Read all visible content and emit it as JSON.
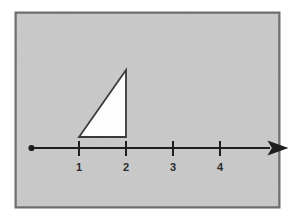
{
  "figure": {
    "panel": {
      "name": "figure-panel",
      "background_color": "#c9c9c9",
      "border_color": "#6e6e6e",
      "x": 15,
      "y": 12,
      "width": 265,
      "height": 196
    }
  },
  "chart_data": {
    "type": "line",
    "xlabel": "",
    "ylabel": "",
    "grid": false,
    "legend": null,
    "axis": {
      "name": "number-line",
      "orientation": "horizontal",
      "color": "#1e1e1e",
      "y_pixel": 148,
      "start_pixel": 31,
      "end_pixel": 275,
      "start_cap": "dot",
      "end_cap": "arrow",
      "xlim": [
        0,
        5.2
      ],
      "tick_spacing_pixels": 47
    },
    "ticks": [
      {
        "label": "1",
        "value": 1,
        "x_pixel": 79
      },
      {
        "label": "2",
        "value": 2,
        "x_pixel": 126
      },
      {
        "label": "3",
        "value": 3,
        "x_pixel": 173
      },
      {
        "label": "4",
        "value": 4,
        "x_pixel": 220
      }
    ],
    "tick_labels": [
      "1",
      "2",
      "3",
      "4"
    ],
    "shapes": [
      {
        "name": "right-triangle",
        "type": "triangle",
        "fill": "#fdfdfd",
        "stroke": "#3a3a3a",
        "right_angle_at": "bottom-right",
        "base_from_value": 1,
        "base_to_value": 2,
        "base_width_units": 1,
        "height_units": 1.43,
        "vertices_pixels": [
          {
            "x": 79,
            "y": 137
          },
          {
            "x": 126,
            "y": 137
          },
          {
            "x": 126,
            "y": 70
          }
        ],
        "points_attr": "79,137 126,137 126,70"
      }
    ]
  }
}
